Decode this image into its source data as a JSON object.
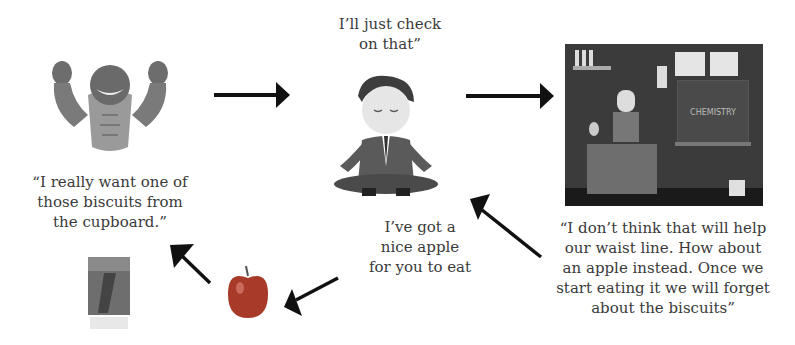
{
  "diagram": {
    "nodes": [
      {
        "id": "impulse",
        "icon": "muscular-beast-icon",
        "caption": "“I really want one of\nthose biscuits from\nthe cupboard.”"
      },
      {
        "id": "pause",
        "icon": "meditating-man-icon",
        "caption": "I’ll just check\non that”"
      },
      {
        "id": "reason",
        "icon": "chemistry-teacher-icon",
        "board_text": "CHEMISTRY",
        "caption": "“I don’t think that will help\nour waist line. How about\nan apple instead. Once we\nstart eating it we will forget\nabout the biscuits”"
      },
      {
        "id": "offer",
        "caption": "I’ve got a\nnice apple\nfor you to eat"
      },
      {
        "id": "apple",
        "icon": "apple-icon"
      },
      {
        "id": "biscuits",
        "icon": "biscuit-box-icon"
      }
    ],
    "edges": [
      {
        "from": "impulse",
        "to": "pause"
      },
      {
        "from": "pause",
        "to": "reason"
      },
      {
        "from": "reason",
        "to": "pause"
      },
      {
        "from": "offer",
        "to": "apple"
      },
      {
        "from": "apple",
        "to": "biscuits"
      }
    ],
    "colors": {
      "arrow": "#111111",
      "text": "#3a3a3a",
      "apple": "#a83a2a",
      "board": "#3a3a3a"
    }
  }
}
